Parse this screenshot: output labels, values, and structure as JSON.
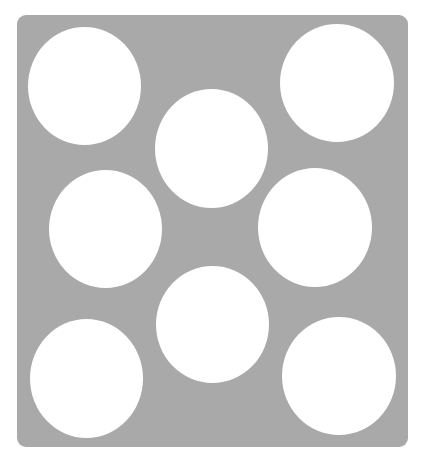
{
  "board": {
    "color": "#a9a9a9",
    "hole_color": "#ffffff",
    "holes": [
      {
        "name": "top-left",
        "left": 11,
        "top": 12,
        "width": 113,
        "height": 118
      },
      {
        "name": "top-right",
        "left": 263,
        "top": 9,
        "width": 114,
        "height": 118
      },
      {
        "name": "top-center",
        "left": 138,
        "top": 74,
        "width": 113,
        "height": 119
      },
      {
        "name": "middle-left",
        "left": 32,
        "top": 155,
        "width": 113,
        "height": 118
      },
      {
        "name": "middle-right",
        "left": 241,
        "top": 153,
        "width": 114,
        "height": 119
      },
      {
        "name": "bottom-center",
        "left": 139,
        "top": 251,
        "width": 113,
        "height": 117
      },
      {
        "name": "bottom-left",
        "left": 13,
        "top": 304,
        "width": 113,
        "height": 119
      },
      {
        "name": "bottom-right",
        "left": 265,
        "top": 302,
        "width": 114,
        "height": 118
      }
    ]
  }
}
